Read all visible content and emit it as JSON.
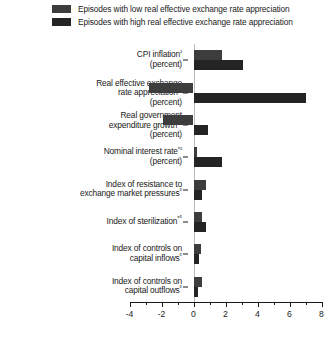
{
  "legend": {
    "items": [
      {
        "label": "Episodes with low real effective exchange rate appreciation",
        "color": "#3d3d3d",
        "key": "low"
      },
      {
        "label": "Episodes with high real effective exchange rate appreciation",
        "color": "#242424",
        "key": "high"
      }
    ]
  },
  "chart_data": {
    "type": "bar",
    "orientation": "horizontal",
    "title": "",
    "xlabel": "",
    "ylabel": "",
    "xlim": [
      -4,
      8
    ],
    "grid": false,
    "legend_position": "top",
    "xticks": [
      -4,
      -2,
      0,
      2,
      4,
      6,
      8
    ],
    "xtick_labels": [
      "-4",
      "-2",
      "0",
      "2",
      "4",
      "6",
      "8"
    ],
    "xticks_minor": [
      -3,
      -1,
      1,
      3,
      5,
      7
    ],
    "categories": [
      "CPI inflation²\n(percent)",
      "Real effective exchange\nrate appreciation*³\n(percent)",
      "Real government\nexpenditure growth*⁴\n(percent)",
      "Nominal interest rate*²\n(percent)",
      "Index of resistance to\nexchange market pressures⁵",
      "Index of sterilization*⁵",
      "Index of controls on\ncapital inflows⁵",
      "Index of controls on\ncapital outflows⁵"
    ],
    "series": [
      {
        "name": "Episodes with low real effective exchange rate appreciation",
        "key": "low",
        "color": "#3d3d3d",
        "values": [
          1.8,
          -2.8,
          -1.9,
          0.2,
          0.75,
          0.5,
          0.45,
          0.5
        ]
      },
      {
        "name": "Episodes with high real effective exchange rate appreciation",
        "key": "high",
        "color": "#242424",
        "values": [
          3.1,
          7.0,
          0.9,
          1.8,
          0.55,
          0.8,
          0.35,
          0.3
        ]
      }
    ]
  }
}
